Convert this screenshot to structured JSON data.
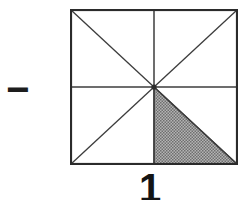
{
  "diagram": {
    "operator": "−",
    "caption": "1",
    "shape": {
      "name": "square-divided-into-eighths",
      "divisions": "horizontal midline, vertical midline, both diagonals",
      "shaded_region": "triangle with vertices at center, bottom midpoint, bottom-right corner",
      "shaded_count": 1,
      "total_regions": 8
    },
    "colors": {
      "background": "#ffffff",
      "border": "#2b2b2b",
      "line": "#3c3c3c",
      "shade_light": "#b4b4b4",
      "shade_dark": "#6f6f6f",
      "center_dot": "#2b2b2b"
    }
  }
}
